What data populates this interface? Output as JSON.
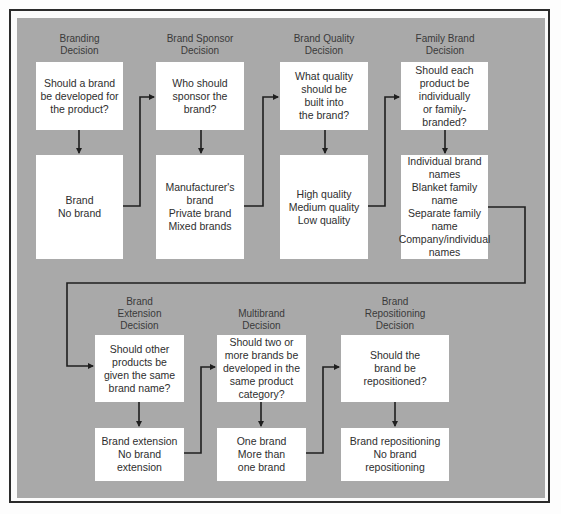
{
  "diagram": {
    "type": "flowchart",
    "colors": {
      "background": "#fbfbfb",
      "panel": "#a9a9a9",
      "box": "#ffffff",
      "line": "#1f1f1f"
    },
    "top_row": [
      {
        "title": "Branding\nDecision",
        "question": "Should a brand\nbe developed for\nthe product?",
        "options": "Brand\nNo brand"
      },
      {
        "title": "Brand Sponsor\nDecision",
        "question": "Who should\nsponsor the\nbrand?",
        "options": "Manufacturer's\nbrand\nPrivate brand\nMixed brands"
      },
      {
        "title": "Brand Quality\nDecision",
        "question": "What quality\nshould be\nbuilt into\nthe brand?",
        "options": "High quality\nMedium quality\nLow quality"
      },
      {
        "title": "Family Brand\nDecision",
        "question": "Should each\nproduct be\nindividually\nor family-\nbranded?",
        "options": "Individual brand\nnames\nBlanket family\nname\nSeparate family\nname\nCompany/individual\nnames"
      }
    ],
    "bottom_row": [
      {
        "title": "Brand\nExtension\nDecision",
        "question": "Should other\nproducts be\ngiven the same\nbrand name?",
        "options": "Brand extension\nNo brand\nextension"
      },
      {
        "title": "Multibrand\nDecision",
        "question": "Should two or\nmore brands be\ndeveloped in the\nsame product\ncategory?",
        "options": "One brand\nMore than\none brand"
      },
      {
        "title": "Brand\nRepositioning\nDecision",
        "question": "Should the\nbrand be\nrepositioned?",
        "options": "Brand repositioning\nNo brand\nrepositioning"
      }
    ]
  }
}
